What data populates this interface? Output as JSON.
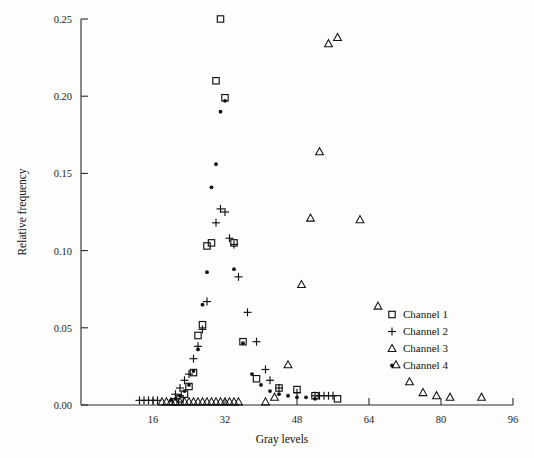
{
  "chart_data": {
    "type": "scatter",
    "title": "",
    "xlabel": "Gray levels",
    "ylabel": "Relative frequency",
    "xlim": [
      0,
      96
    ],
    "ylim": [
      0.0,
      0.25
    ],
    "xticks": [
      16,
      32,
      48,
      64,
      80,
      96
    ],
    "xtick_labels": [
      "16",
      "32",
      "48",
      "64",
      "80",
      "96"
    ],
    "yticks": [
      0.0,
      0.05,
      0.1,
      0.15,
      0.2,
      0.25
    ],
    "ytick_labels": [
      "0.00",
      "0.05",
      "0.10",
      "0.15",
      "0.20",
      "0.25"
    ],
    "grid": false,
    "legend_position": "center-right",
    "series": [
      {
        "name": "Channel 1",
        "marker": "square",
        "points": [
          [
            21,
            0.002
          ],
          [
            22,
            0.004
          ],
          [
            23,
            0.007
          ],
          [
            24,
            0.012
          ],
          [
            25,
            0.021
          ],
          [
            26,
            0.045
          ],
          [
            27,
            0.052
          ],
          [
            28,
            0.103
          ],
          [
            29,
            0.105
          ],
          [
            30,
            0.21
          ],
          [
            31,
            0.25
          ],
          [
            32,
            0.199
          ],
          [
            34,
            0.105
          ],
          [
            36,
            0.041
          ],
          [
            39,
            0.017
          ],
          [
            44,
            0.011
          ],
          [
            48,
            0.01
          ],
          [
            52,
            0.006
          ],
          [
            57,
            0.004
          ]
        ]
      },
      {
        "name": "Channel 2",
        "marker": "plus",
        "points": [
          [
            13,
            0.003
          ],
          [
            14,
            0.003
          ],
          [
            15,
            0.003
          ],
          [
            16,
            0.003
          ],
          [
            17,
            0.003
          ],
          [
            21,
            0.007
          ],
          [
            22,
            0.011
          ],
          [
            23,
            0.016
          ],
          [
            24,
            0.02
          ],
          [
            25,
            0.03
          ],
          [
            26,
            0.038
          ],
          [
            27,
            0.049
          ],
          [
            28,
            0.067
          ],
          [
            30,
            0.118
          ],
          [
            31,
            0.127
          ],
          [
            32,
            0.125
          ],
          [
            33,
            0.108
          ],
          [
            34,
            0.104
          ],
          [
            35,
            0.083
          ],
          [
            37,
            0.06
          ],
          [
            39,
            0.041
          ],
          [
            41,
            0.023
          ],
          [
            42,
            0.016
          ],
          [
            44,
            0.011
          ],
          [
            48,
            0.008
          ],
          [
            52,
            0.006
          ],
          [
            53,
            0.006
          ],
          [
            54,
            0.006
          ],
          [
            55,
            0.006
          ],
          [
            56,
            0.006
          ]
        ]
      },
      {
        "name": "Channel 3",
        "marker": "triangle",
        "points": [
          [
            18,
            0.002
          ],
          [
            19,
            0.002
          ],
          [
            20,
            0.002
          ],
          [
            21,
            0.002
          ],
          [
            22,
            0.002
          ],
          [
            23,
            0.002
          ],
          [
            24,
            0.002
          ],
          [
            25,
            0.002
          ],
          [
            26,
            0.002
          ],
          [
            27,
            0.002
          ],
          [
            28,
            0.002
          ],
          [
            29,
            0.002
          ],
          [
            30,
            0.002
          ],
          [
            31,
            0.002
          ],
          [
            32,
            0.002
          ],
          [
            33,
            0.002
          ],
          [
            34,
            0.002
          ],
          [
            35,
            0.002
          ],
          [
            41,
            0.002
          ],
          [
            43,
            0.005
          ],
          [
            46,
            0.026
          ],
          [
            49,
            0.078
          ],
          [
            51,
            0.121
          ],
          [
            53,
            0.164
          ],
          [
            55,
            0.234
          ],
          [
            57,
            0.238
          ],
          [
            62,
            0.12
          ],
          [
            66,
            0.064
          ],
          [
            70,
            0.026
          ],
          [
            73,
            0.015
          ],
          [
            76,
            0.008
          ],
          [
            79,
            0.006
          ],
          [
            82,
            0.005
          ],
          [
            89,
            0.005
          ]
        ]
      },
      {
        "name": "Channel 4",
        "marker": "dot",
        "points": [
          [
            20,
            0.003
          ],
          [
            21,
            0.004
          ],
          [
            22,
            0.006
          ],
          [
            23,
            0.009
          ],
          [
            24,
            0.013
          ],
          [
            25,
            0.022
          ],
          [
            26,
            0.036
          ],
          [
            27,
            0.065
          ],
          [
            28,
            0.086
          ],
          [
            29,
            0.141
          ],
          [
            30,
            0.156
          ],
          [
            31,
            0.19
          ],
          [
            32,
            0.197
          ],
          [
            34,
            0.088
          ],
          [
            36,
            0.04
          ],
          [
            38,
            0.02
          ],
          [
            40,
            0.013
          ],
          [
            42,
            0.009
          ],
          [
            44,
            0.007
          ],
          [
            46,
            0.006
          ],
          [
            48,
            0.005
          ],
          [
            50,
            0.005
          ],
          [
            52,
            0.004
          ]
        ]
      }
    ]
  },
  "legend": {
    "entries": [
      {
        "label": "Channel 1",
        "marker": "square"
      },
      {
        "label": "Channel 2",
        "marker": "plus"
      },
      {
        "label": "Channel 3",
        "marker": "triangle"
      },
      {
        "label": "Channel 4",
        "marker": "dot"
      }
    ]
  }
}
